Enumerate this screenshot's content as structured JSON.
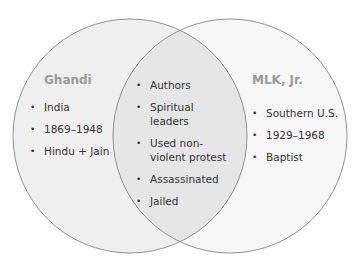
{
  "diagram": {
    "type": "venn",
    "truncated_title": "g   m p",
    "left": {
      "title": "Ghandi",
      "items": [
        "India",
        "1869–1948",
        "Hindu + Jain"
      ]
    },
    "overlap": {
      "items": [
        "Authors",
        "Spiritual leaders",
        "Used non-violent protest",
        "Assassinated",
        "Jailed"
      ]
    },
    "right": {
      "title": "MLK, Jr.",
      "items": [
        "Southern U.S.",
        "1929–1968",
        "Baptist"
      ]
    },
    "colors": {
      "left_fill": "#efefef",
      "right_fill": "#f7f7f7",
      "overlap_fill": "#e6e6e6",
      "stroke": "#777777",
      "title_color": "#9a9a9a"
    }
  }
}
